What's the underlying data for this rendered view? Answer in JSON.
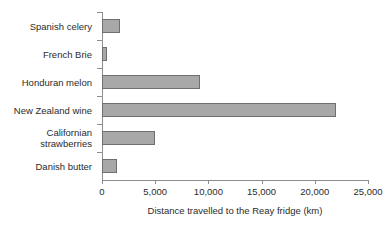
{
  "chart_data": {
    "type": "bar",
    "orientation": "horizontal",
    "title": "",
    "xlabel": "Distance travelled to the Reay fridge (km)",
    "ylabel": "",
    "categories": [
      "Spanish celery",
      "French Brie",
      "Honduran melon",
      "New Zealand wine",
      "Californian strawberries",
      "Danish butter"
    ],
    "values": [
      1700,
      500,
      9200,
      22000,
      5000,
      1400
    ],
    "xlim": [
      0,
      25000
    ],
    "xticks": [
      0,
      5000,
      10000,
      15000,
      20000,
      25000
    ],
    "xtick_labels": [
      "0",
      "5,000",
      "10,000",
      "15,000",
      "20,000",
      "25,000"
    ],
    "grid": false,
    "legend": null,
    "bar_fill_color": "#a8a8a8",
    "bar_border_color": "#6f6f6f",
    "axis_color": "#8d8d8d",
    "text_color": "#2b2b2b",
    "background_color": "#ffffff"
  }
}
